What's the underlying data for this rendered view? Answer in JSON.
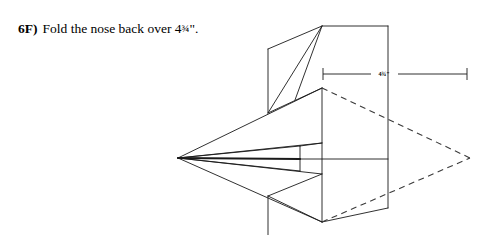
{
  "page": {
    "background_color": "#ffffff",
    "ink_color": "#1a1a1a",
    "width": 493,
    "height": 235
  },
  "instruction": {
    "step_label": "6F)",
    "text_before": "Fold the nose back over 4",
    "fraction": "¾",
    "text_after": "\"."
  },
  "diagram": {
    "name": "paper-airplane-nose-fold",
    "dimension": {
      "label_whole": "4",
      "label_fraction": "¾",
      "label_unit": "\"",
      "label_full": "4¾\"",
      "line_start_x": 323,
      "line_end_x": 467,
      "line_y": 74
    },
    "nose_tip": {
      "x": 178,
      "y": 158
    },
    "fold_target_tip": {
      "x": 470,
      "y": 158
    }
  }
}
